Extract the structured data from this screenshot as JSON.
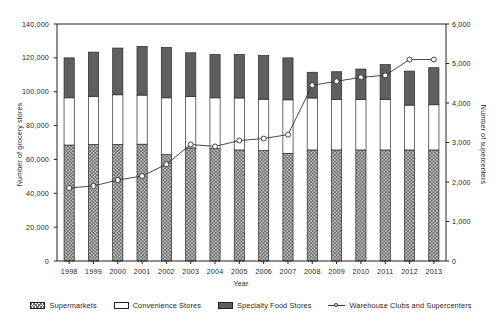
{
  "chart_data": {
    "type": "bar",
    "title": "",
    "xlabel": "Year",
    "ylabel": "Number of grocery stores",
    "y2label": "Number of supercenters",
    "grid": false,
    "legend_position": "bottom",
    "categories": [
      "1998",
      "1999",
      "2000",
      "2001",
      "2002",
      "2003",
      "2004",
      "2005",
      "2006",
      "2007",
      "2008",
      "2009",
      "2010",
      "2011",
      "2012",
      "2013"
    ],
    "ylim": [
      0,
      140000
    ],
    "yticks": [
      "0",
      "20,000",
      "40,000",
      "60,000",
      "80,000",
      "100,000",
      "120,000",
      "140,000"
    ],
    "ytick_values": [
      0,
      20000,
      40000,
      60000,
      80000,
      100000,
      120000,
      140000
    ],
    "y2lim": [
      0,
      6000
    ],
    "y2ticks": [
      "0",
      "1,000",
      "2,000",
      "3,000",
      "4,000",
      "5,000",
      "6,000"
    ],
    "y2tick_values": [
      0,
      1000,
      2000,
      3000,
      4000,
      5000,
      6000
    ],
    "series": [
      {
        "name": "Supermarkets",
        "axis": "left",
        "stacked": true,
        "fill": "hatch-diagonal",
        "values": [
          68500,
          68800,
          68800,
          69000,
          62800,
          66800,
          66400,
          65600,
          65200,
          63600,
          65600,
          65600,
          65600,
          65600,
          65600,
          65600
        ]
      },
      {
        "name": "Convenience Stores",
        "axis": "left",
        "stacked": true,
        "fill": "white",
        "values": [
          27900,
          28500,
          29400,
          29000,
          33600,
          30500,
          30000,
          30700,
          30400,
          31600,
          30700,
          29900,
          29900,
          29900,
          26500,
          26700
        ]
      },
      {
        "name": "Specialty Food Stores",
        "axis": "left",
        "stacked": true,
        "fill": "dark-gray",
        "values": [
          23600,
          26100,
          27600,
          28800,
          29800,
          25700,
          25600,
          25700,
          25800,
          24800,
          15200,
          16300,
          17900,
          20500,
          20100,
          21900
        ]
      },
      {
        "name": "Warehouse Clubs and Supercenters",
        "axis": "right",
        "type": "line",
        "marker": "open-circle",
        "values": [
          1850,
          1900,
          2050,
          2150,
          2450,
          2950,
          2900,
          3050,
          3100,
          3200,
          4450,
          4550,
          4650,
          4700,
          5100,
          5100
        ]
      }
    ],
    "bar_totals": [
      120000,
      123400,
      125800,
      126800,
      126200,
      123000,
      122000,
      122000,
      121400,
      120000,
      111500,
      111800,
      113400,
      116000,
      112200,
      114200
    ]
  },
  "legend": {
    "items": [
      {
        "label": "Supermarkets",
        "swatch": "hatch-swatch-icon"
      },
      {
        "label": "Convenience Stores",
        "swatch": "white-swatch-icon"
      },
      {
        "label": "Specialty Food Stores",
        "swatch": "dark-swatch-icon"
      },
      {
        "label": "Warehouse Clubs and Supercenters",
        "swatch": "line-marker-icon"
      }
    ]
  },
  "colors": {
    "specialty": "#5f5f5f",
    "convenience": "#ffffff",
    "supermarket_hatch": "#6d6d6d",
    "line": "#333333",
    "axis": "#222222",
    "text": "#1f1f1f",
    "background": "#ffffff"
  }
}
